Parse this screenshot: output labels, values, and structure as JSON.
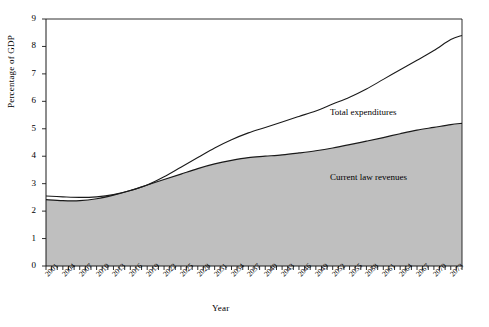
{
  "chart_data": {
    "type": "area",
    "title": "",
    "xlabel": "Year",
    "ylabel": "Percentage of GDP",
    "xlim": [
      2001,
      2075
    ],
    "ylim": [
      0,
      9
    ],
    "ytick_values": [
      0,
      1,
      2,
      3,
      4,
      5,
      6,
      7,
      8,
      9
    ],
    "ytick_labels": [
      "0",
      "1",
      "2",
      "3",
      "4",
      "5",
      "6",
      "7",
      "8",
      "9"
    ],
    "xtick_labels": [
      "2001",
      "2004",
      "2007",
      "2010",
      "2013",
      "2016",
      "2019",
      "2022",
      "2025",
      "2028",
      "2031",
      "2034",
      "2037",
      "2040",
      "2043",
      "2046",
      "2049",
      "2052",
      "2055",
      "2058",
      "2061",
      "2064",
      "2067",
      "2070",
      "2073"
    ],
    "xtick_step_years": 3,
    "minor_tick_step_years": 1,
    "grid": false,
    "legend_position": "inline-annotations",
    "series": [
      {
        "name": "Total expenditures",
        "style": "line",
        "color": "#1a1a1a",
        "x": [
          2001,
          2004,
          2007,
          2010,
          2013,
          2016,
          2019,
          2022,
          2025,
          2028,
          2031,
          2034,
          2037,
          2040,
          2043,
          2046,
          2049,
          2052,
          2055,
          2058,
          2061,
          2064,
          2067,
          2070,
          2073,
          2075
        ],
        "values": [
          2.55,
          2.52,
          2.5,
          2.52,
          2.6,
          2.75,
          2.95,
          3.25,
          3.6,
          3.95,
          4.3,
          4.6,
          4.85,
          5.05,
          5.25,
          5.45,
          5.65,
          5.9,
          6.15,
          6.45,
          6.8,
          7.15,
          7.5,
          7.85,
          8.25,
          8.4
        ]
      },
      {
        "name": "Current law revenues",
        "style": "area",
        "color": "#1a1a1a",
        "fill": "#bfbfbf",
        "x": [
          2001,
          2004,
          2007,
          2010,
          2013,
          2016,
          2019,
          2022,
          2025,
          2028,
          2031,
          2034,
          2037,
          2040,
          2043,
          2046,
          2049,
          2052,
          2055,
          2058,
          2061,
          2064,
          2067,
          2070,
          2073,
          2075
        ],
        "values": [
          2.42,
          2.38,
          2.38,
          2.45,
          2.58,
          2.75,
          2.95,
          3.15,
          3.35,
          3.55,
          3.72,
          3.85,
          3.95,
          4.0,
          4.05,
          4.12,
          4.2,
          4.3,
          4.42,
          4.55,
          4.68,
          4.82,
          4.95,
          5.05,
          5.15,
          5.2
        ]
      }
    ],
    "annotations": [
      {
        "name": "total-expenditures-label",
        "text": "Total expenditures"
      },
      {
        "name": "current-law-revenues-label",
        "text": "Current law revenues"
      }
    ]
  },
  "axes": {
    "x_title": "Year",
    "y_title": "Percentage of GDP"
  }
}
